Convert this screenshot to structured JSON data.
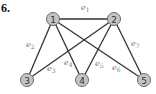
{
  "problem_number": "6.",
  "graph": {
    "nodes": [
      {
        "id": "1",
        "label": "1",
        "x": 53,
        "y": 19
      },
      {
        "id": "2",
        "label": "2",
        "x": 114,
        "y": 19
      },
      {
        "id": "3",
        "label": "3",
        "x": 27,
        "y": 80
      },
      {
        "id": "4",
        "label": "4",
        "x": 82,
        "y": 80
      },
      {
        "id": "5",
        "label": "5",
        "x": 144,
        "y": 80
      }
    ],
    "edges": [
      {
        "id": "e1",
        "base": "e",
        "sub": "1",
        "from": "1",
        "to": "2",
        "lx": 81,
        "ly": 10
      },
      {
        "id": "e2",
        "base": "e",
        "sub": "2",
        "from": "1",
        "to": "3",
        "lx": 26,
        "ly": 47
      },
      {
        "id": "e3",
        "base": "e",
        "sub": "3",
        "from": "2",
        "to": "3",
        "lx": 47,
        "ly": 71
      },
      {
        "id": "e4",
        "base": "e",
        "sub": "4",
        "from": "1",
        "to": "4",
        "lx": 64,
        "ly": 65
      },
      {
        "id": "e5",
        "base": "e",
        "sub": "5",
        "from": "2",
        "to": "4",
        "lx": 95,
        "ly": 66
      },
      {
        "id": "e6",
        "base": "e",
        "sub": "6",
        "from": "1",
        "to": "5",
        "lx": 112,
        "ly": 70
      },
      {
        "id": "e7",
        "base": "e",
        "sub": "7",
        "from": "2",
        "to": "5",
        "lx": 131,
        "ly": 46
      }
    ]
  }
}
